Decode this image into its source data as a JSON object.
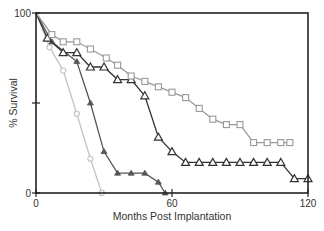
{
  "chart_data": {
    "type": "line",
    "title": "",
    "xlabel": "Months Post Implantation",
    "ylabel": "% Survival",
    "xlim": [
      0,
      120
    ],
    "ylim": [
      0,
      100
    ],
    "x_ticks": [
      0,
      60,
      120
    ],
    "x_tick_labels": [
      "0",
      "60",
      "120"
    ],
    "y_ticks": [
      0,
      50,
      100
    ],
    "y_tick_labels": [
      "0",
      "",
      "100"
    ],
    "grid": false,
    "legend": "none",
    "series": [
      {
        "name": "series-circles",
        "marker": "circle-open",
        "color": "#c4c4c4",
        "x": [
          0,
          6,
          12,
          18,
          24,
          29
        ],
        "y": [
          100,
          81,
          68,
          44,
          19,
          0
        ]
      },
      {
        "name": "series-filled-triangles",
        "marker": "triangle-filled",
        "color": "#555555",
        "x": [
          0,
          7,
          18,
          24,
          30,
          36,
          42,
          48,
          54,
          57
        ],
        "y": [
          100,
          84,
          73,
          50,
          23,
          11,
          11,
          11,
          6,
          0
        ]
      },
      {
        "name": "series-open-triangles",
        "marker": "triangle-open",
        "color": "#333333",
        "x": [
          0,
          5,
          12,
          18,
          24,
          30,
          36,
          42,
          48,
          54,
          60,
          66,
          72,
          78,
          84,
          90,
          96,
          102,
          108,
          114,
          120
        ],
        "y": [
          100,
          86,
          78,
          78,
          70,
          70,
          63,
          63,
          54,
          31,
          23,
          17,
          17,
          17,
          17,
          17,
          17,
          17,
          17,
          8,
          8
        ]
      },
      {
        "name": "series-squares",
        "marker": "square-open",
        "color": "#999999",
        "x": [
          0,
          7,
          12,
          18,
          24,
          31,
          36,
          42,
          48,
          54,
          60,
          66,
          72,
          78,
          84,
          90,
          96,
          102,
          108,
          112
        ],
        "y": [
          100,
          88,
          84,
          84,
          80,
          75,
          71,
          65,
          62,
          59,
          56,
          53,
          47,
          41,
          38,
          38,
          28,
          28,
          28,
          28
        ]
      }
    ]
  }
}
